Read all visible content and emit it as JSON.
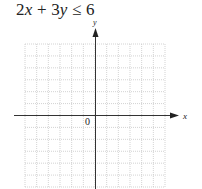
{
  "problem": {
    "inequality": "2x + 3y ≤ 6",
    "parts": [
      {
        "text": "2",
        "italic": false
      },
      {
        "text": "x",
        "italic": true
      },
      {
        "text": " + 3",
        "italic": false
      },
      {
        "text": "y",
        "italic": true
      },
      {
        "text": " ≤ 6",
        "italic": false
      }
    ]
  },
  "graph": {
    "x_axis_label": "x",
    "y_axis_label": "y",
    "origin_label": "0",
    "grid": {
      "x_min": -6,
      "x_max": 6,
      "y_min": -6,
      "y_max": 6,
      "step": 1
    },
    "colors": {
      "grid": "#c8c8c8",
      "axis": "#333333",
      "text": "#222222"
    }
  }
}
